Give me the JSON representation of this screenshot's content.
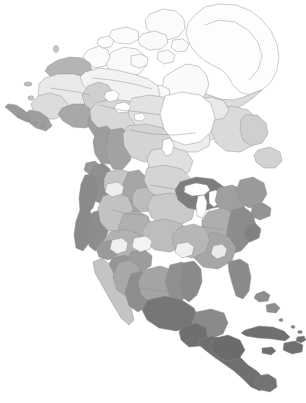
{
  "figure": {
    "type": "thematic-choropleth-map",
    "region": "North America",
    "background_color": "#ffffff",
    "outline_color": "#8d8d8d",
    "width": 306,
    "height": 403,
    "projection_note": "polar-oriented continental view",
    "has_legend": false,
    "has_labels": false,
    "has_graticule": false
  },
  "palette": {
    "water": "#ffffff",
    "tone_white": "#fbfbfb",
    "tone_lightest": "#f0f0f0",
    "tone_lighter": "#e6e6e6",
    "tone_light": "#dcdcdc",
    "tone_light_mid": "#d2d2d2",
    "tone_mid_light": "#c6c6c6",
    "tone_mid": "#b9b9b9",
    "tone_mid_dark": "#ababab",
    "tone_dark": "#9b9b9b",
    "tone_darker": "#8b8b8b",
    "tone_darkest": "#787878",
    "tone_deep": "#6d6d6d"
  },
  "regions": [
    {
      "name": "greenland-ice-sheet",
      "tone": "#fdfdfd"
    },
    {
      "name": "greenland-coastal-margin",
      "tone": "#dcdcdc"
    },
    {
      "name": "canadian-arctic-archipelago",
      "tone": "#fafafa"
    },
    {
      "name": "arctic-tundra",
      "tone": "#f2f2f2"
    },
    {
      "name": "hudson-bay-lowlands",
      "tone": "#ededed"
    },
    {
      "name": "boreal-shield",
      "tone": "#e2e2e2"
    },
    {
      "name": "boreal-plains",
      "tone": "#d8d8d8"
    },
    {
      "name": "taiga-cordillera",
      "tone": "#cfcfcf"
    },
    {
      "name": "alaska-interior",
      "tone": "#e9e9e9"
    },
    {
      "name": "alaska-north-slope",
      "tone": "#b4b4b4"
    },
    {
      "name": "alaska-pacific-coast",
      "tone": "#a8a8a8"
    },
    {
      "name": "aleutian-chain",
      "tone": "#9a9a9a"
    },
    {
      "name": "pacific-maritime-northwest",
      "tone": "#9d9d9d"
    },
    {
      "name": "cascade-sierra-range",
      "tone": "#8f8f8f"
    },
    {
      "name": "california-coastal",
      "tone": "#8a8a8a"
    },
    {
      "name": "great-basin",
      "tone": "#c2c2c2"
    },
    {
      "name": "colorado-plateau",
      "tone": "#b0b0b0"
    },
    {
      "name": "rocky-mountains",
      "tone": "#a2a2a2"
    },
    {
      "name": "northern-great-plains",
      "tone": "#d4d4d4"
    },
    {
      "name": "central-great-plains",
      "tone": "#c9c9c9"
    },
    {
      "name": "southern-great-plains",
      "tone": "#bdbdbd"
    },
    {
      "name": "prairie-pothole",
      "tone": "#e0e0e0"
    },
    {
      "name": "great-lakes-basin",
      "tone": "#7e7e7e"
    },
    {
      "name": "great-lakes-water",
      "tone": "#ffffff"
    },
    {
      "name": "mixed-wood-plains",
      "tone": "#9f9f9f"
    },
    {
      "name": "appalachian-highlands",
      "tone": "#aeaeae"
    },
    {
      "name": "atlantic-coastal-plain",
      "tone": "#8c8c8c"
    },
    {
      "name": "southeast-plains",
      "tone": "#a6a6a6"
    },
    {
      "name": "mississippi-alluvial",
      "tone": "#b6b6b6"
    },
    {
      "name": "baja-peninsula",
      "tone": "#c4c4c4"
    },
    {
      "name": "sonoran-chihuahuan-desert",
      "tone": "#b2b2b2"
    },
    {
      "name": "sierra-madre",
      "tone": "#8d8d8d"
    },
    {
      "name": "mexican-plateau",
      "tone": "#a4a4a4"
    },
    {
      "name": "central-america-tropical",
      "tone": "#6f6f6f"
    },
    {
      "name": "yucatan-peninsula",
      "tone": "#8a8a8a"
    },
    {
      "name": "caribbean-islands",
      "tone": "#6f6f6f"
    },
    {
      "name": "newfoundland-labrador",
      "tone": "#dadada"
    },
    {
      "name": "atlantic-maritime",
      "tone": "#9a9a9a"
    }
  ],
  "water_bodies": [
    {
      "name": "pacific-ocean"
    },
    {
      "name": "atlantic-ocean"
    },
    {
      "name": "arctic-ocean"
    },
    {
      "name": "hudson-bay"
    },
    {
      "name": "gulf-of-mexico"
    },
    {
      "name": "gulf-of-california"
    },
    {
      "name": "caribbean-sea"
    },
    {
      "name": "great-lakes"
    },
    {
      "name": "great-slave-lake"
    },
    {
      "name": "great-bear-lake"
    },
    {
      "name": "lake-winnipeg"
    },
    {
      "name": "baffin-bay"
    }
  ]
}
